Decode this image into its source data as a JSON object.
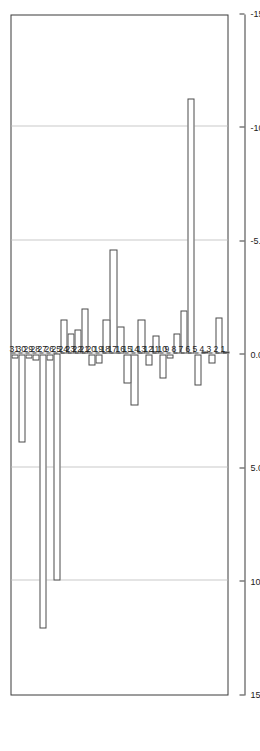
{
  "chart_data": {
    "type": "bar",
    "orientation": "horizontal-rotated",
    "title": "",
    "xlabel": "",
    "ylabel": "%",
    "axis_title": "%",
    "categories": [
      "1",
      "2",
      "3",
      "4",
      "5",
      "6",
      "7",
      "8",
      "9",
      "10",
      "11",
      "12",
      "13",
      "14",
      "15",
      "16",
      "17",
      "18",
      "19",
      "20",
      "21",
      "22",
      "23",
      "24",
      "25",
      "26",
      "27",
      "28",
      "29",
      "30",
      "31"
    ],
    "values": [
      -0.1,
      -1.6,
      0.4,
      -0.1,
      1.4,
      -11.25,
      -1.9,
      -0.9,
      0.2,
      1.1,
      -0.8,
      0.5,
      -1.5,
      2.25,
      1.3,
      -1.2,
      -4.6,
      -1.5,
      0.4,
      0.5,
      -2.0,
      -1.1,
      -0.9,
      -1.5,
      10.0,
      0.3,
      12.1,
      0.3,
      0.2,
      3.9,
      0.2
    ],
    "value_tick_labels": [
      "15.0",
      "10.0",
      "5.0",
      "0.0",
      "-5.0",
      "-10.0",
      "-15.0"
    ],
    "value_ticks": [
      15,
      10,
      5,
      0,
      -5,
      -10,
      -15
    ],
    "xlim": [
      15,
      -15
    ],
    "grid": "vertical-at-value-ticks",
    "legend": "none",
    "bar_fill": "#ffffff",
    "bar_edge": "#4a4a4a",
    "grid_color": "#c9c9c9",
    "axis_color": "#3a3a3a"
  }
}
